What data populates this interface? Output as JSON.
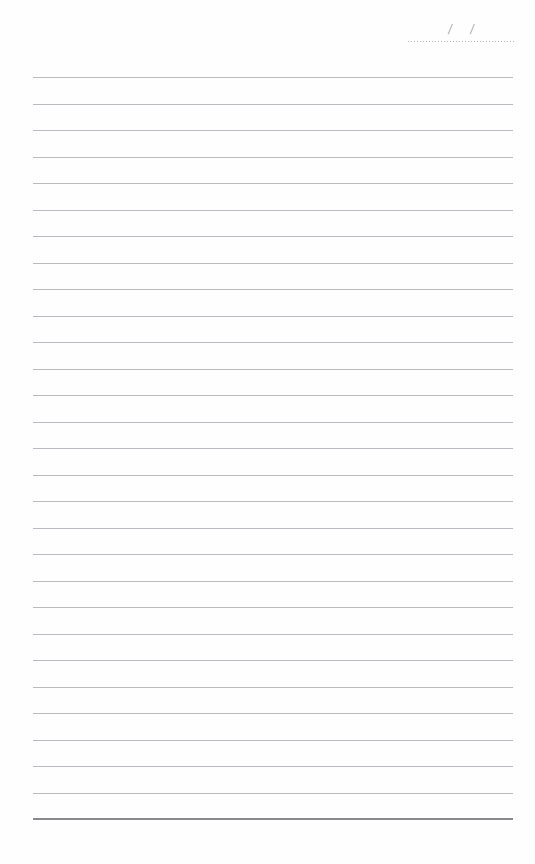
{
  "page": {
    "type": "lined-notepad-page",
    "width": 535,
    "height": 864,
    "background_color": "#fefefe",
    "paper_style": "blank ruled writing sheet"
  },
  "date_field": {
    "name": "date-field",
    "separator_1": "/",
    "separator_2": "/",
    "rule_style": "dotted",
    "rule_color": "#a9a9ae",
    "left": 408,
    "top": 18,
    "width": 106
  },
  "ruled_lines": {
    "count": 29,
    "first_line_y": 77,
    "spacing": 26.5,
    "left": 33,
    "width": 480,
    "color": "#babac0",
    "terminal_line": {
      "y": 818,
      "color": "#88888f",
      "thickness": 2,
      "emphasis": "bottom-border"
    },
    "content": [
      "",
      "",
      "",
      "",
      "",
      "",
      "",
      "",
      "",
      "",
      "",
      "",
      "",
      "",
      "",
      "",
      "",
      "",
      "",
      "",
      "",
      "",
      "",
      "",
      "",
      "",
      "",
      "",
      ""
    ]
  }
}
